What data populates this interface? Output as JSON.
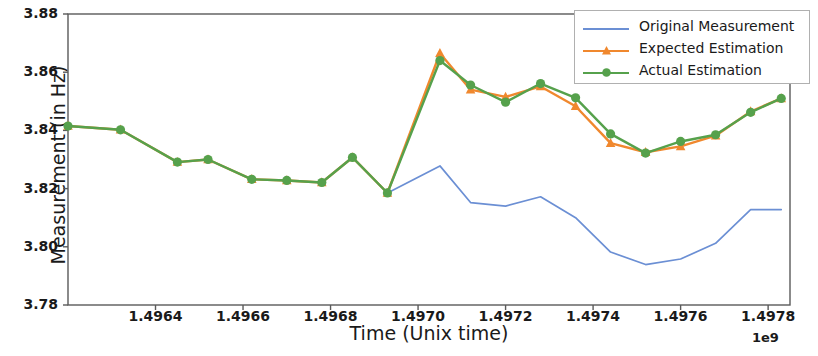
{
  "chart_data": {
    "type": "line",
    "title": "",
    "xlabel": "Time (Unix time)",
    "ylabel": "Measurement  (in Hz)",
    "x_offset_label": "1e9",
    "xlim": [
      1496300000,
      1497850000
    ],
    "ylim": [
      3.78,
      3.88
    ],
    "xticks": [
      1.4964,
      1.4966,
      1.4968,
      1.497,
      1.4972,
      1.4974,
      1.4976,
      1.4978
    ],
    "xtick_labels": [
      "1.4964",
      "1.4966",
      "1.4968",
      "1.4970",
      "1.4972",
      "1.4974",
      "1.4976",
      "1.4978"
    ],
    "yticks": [
      3.78,
      3.8,
      3.82,
      3.84,
      3.86,
      3.88
    ],
    "ytick_labels": [
      "3.78",
      "3.80",
      "3.82",
      "3.84",
      "3.86",
      "3.88"
    ],
    "grid": false,
    "legend_position": "upper right",
    "series": [
      {
        "name": "Original Measurement",
        "color": "#6b8fd4",
        "marker": "none",
        "x": [
          1.49693,
          1.49705,
          1.49712,
          1.4972,
          1.49728,
          1.49736,
          1.49744,
          1.49752,
          1.4976,
          1.49768,
          1.49776,
          1.49783
        ],
        "values": [
          3.8185,
          3.8278,
          3.8152,
          3.814,
          3.8172,
          3.81,
          3.7982,
          3.7939,
          3.7958,
          3.8012,
          3.8128,
          3.8128
        ]
      },
      {
        "name": "Expected Estimation",
        "color": "#f0882e",
        "marker": "triangle",
        "x": [
          1.4962,
          1.49632,
          1.49645,
          1.49652,
          1.49662,
          1.4967,
          1.49678,
          1.49685,
          1.49693,
          1.49705,
          1.49712,
          1.4972,
          1.49728,
          1.49736,
          1.49744,
          1.49752,
          1.4976,
          1.49768,
          1.49776,
          1.49783
        ],
        "values": [
          3.8415,
          3.8402,
          3.8291,
          3.83,
          3.8232,
          3.8228,
          3.8221,
          3.8307,
          3.8185,
          3.8665,
          3.854,
          3.8515,
          3.8551,
          3.8483,
          3.8356,
          3.8325,
          3.8345,
          3.8382,
          3.8465,
          3.851
        ]
      },
      {
        "name": "Actual Estimation",
        "color": "#56a14c",
        "marker": "circle",
        "x": [
          1.4962,
          1.49632,
          1.49645,
          1.49652,
          1.49662,
          1.4967,
          1.49678,
          1.49685,
          1.49693,
          1.49705,
          1.49712,
          1.4972,
          1.49728,
          1.49736,
          1.49744,
          1.49752,
          1.4976,
          1.49768,
          1.49776,
          1.49783
        ],
        "values": [
          3.8415,
          3.8402,
          3.8291,
          3.83,
          3.8232,
          3.8228,
          3.8221,
          3.8307,
          3.8185,
          3.864,
          3.8556,
          3.8497,
          3.8561,
          3.8512,
          3.8388,
          3.8322,
          3.8362,
          3.8385,
          3.8462,
          3.851
        ]
      }
    ]
  },
  "legend": {
    "entries": [
      {
        "label": "Original Measurement"
      },
      {
        "label": "Expected Estimation"
      },
      {
        "label": "Actual Estimation"
      }
    ]
  },
  "axes": {
    "spine_color": "#5a5a5a"
  }
}
